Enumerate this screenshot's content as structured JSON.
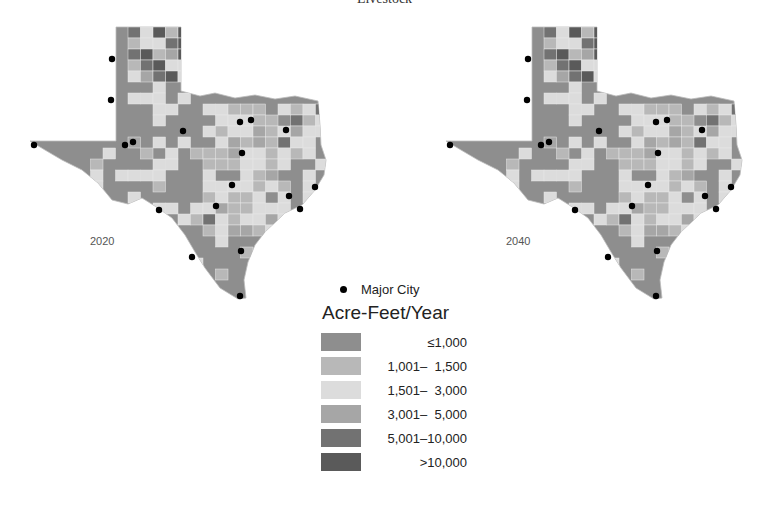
{
  "title": "Livestock",
  "maps": [
    {
      "year_label": "2020",
      "offset_x": 0
    },
    {
      "year_label": "2040",
      "offset_x": 416
    }
  ],
  "legend": {
    "city_label": "Major City",
    "title": "Acre-Feet/Year",
    "classes": [
      {
        "label": "≤1,000",
        "color": "#8e8e8e"
      },
      {
        "label": "1,001–  1,500",
        "color": "#b8b8b8"
      },
      {
        "label": "1,501–  3,000",
        "color": "#dcdcdc"
      },
      {
        "label": "3,001–  5,000",
        "color": "#a6a6a6"
      },
      {
        "label": "5,001–10,000",
        "color": "#727272"
      },
      {
        "label": ">10,000",
        "color": "#5a5a5a"
      }
    ]
  },
  "cities": [
    [
      34,
      145
    ],
    [
      112,
      59
    ],
    [
      111,
      100
    ],
    [
      125,
      145
    ],
    [
      133,
      142
    ],
    [
      183,
      131
    ],
    [
      240,
      122
    ],
    [
      251,
      120
    ],
    [
      286,
      130
    ],
    [
      242,
      153
    ],
    [
      232,
      185
    ],
    [
      216,
      206
    ],
    [
      159,
      210
    ],
    [
      192,
      257
    ],
    [
      241,
      251
    ],
    [
      240,
      296
    ],
    [
      289,
      196
    ],
    [
      300,
      209
    ],
    [
      315,
      187
    ]
  ]
}
